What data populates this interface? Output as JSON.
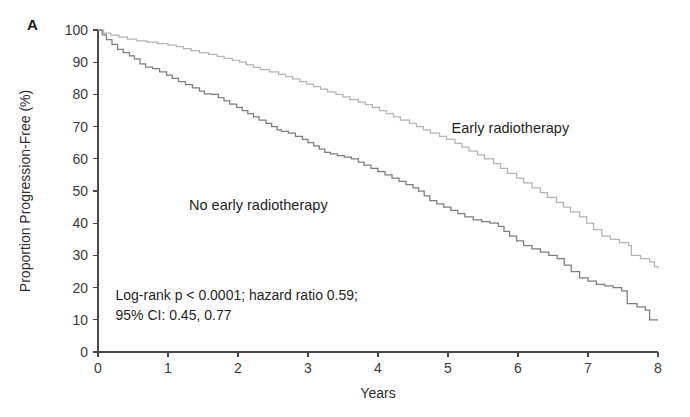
{
  "panel": {
    "label": "A"
  },
  "chart_data": {
    "type": "line",
    "subtype": "kaplan-meier-step",
    "title": "",
    "xlabel": "Years",
    "ylabel": "Proportion Progression-Free (%)",
    "xlim": [
      0,
      8
    ],
    "ylim": [
      0,
      100
    ],
    "xticks": [
      0,
      1,
      2,
      3,
      4,
      5,
      6,
      7,
      8
    ],
    "yticks": [
      0,
      10,
      20,
      30,
      40,
      50,
      60,
      70,
      80,
      90,
      100
    ],
    "grid": false,
    "legend_position": "inline-annotations",
    "annotations": [
      {
        "name": "early-radiotherapy-label",
        "text": "Early radiotherapy",
        "x": 5.05,
        "y": 68
      },
      {
        "name": "no-early-radiotherapy-label",
        "text": "No early radiotherapy",
        "x": 1.3,
        "y": 44
      },
      {
        "name": "stats-line-1",
        "text": "Log-rank p < 0.0001; hazard ratio 0.59;",
        "x": 0.25,
        "y": 16
      },
      {
        "name": "stats-line-2",
        "text": "95% CI: 0.45, 0.77",
        "x": 0.25,
        "y": 10
      }
    ],
    "series": [
      {
        "name": "Early radiotherapy",
        "color": "#b4b4b4",
        "points": [
          [
            0.0,
            100
          ],
          [
            0.08,
            99
          ],
          [
            0.18,
            98.4
          ],
          [
            0.3,
            97.8
          ],
          [
            0.42,
            97.2
          ],
          [
            0.55,
            96.6
          ],
          [
            0.7,
            96.2
          ],
          [
            0.85,
            95.8
          ],
          [
            1.0,
            95.3
          ],
          [
            1.12,
            94.8
          ],
          [
            1.22,
            94.2
          ],
          [
            1.33,
            93.6
          ],
          [
            1.45,
            93.0
          ],
          [
            1.58,
            92.4
          ],
          [
            1.7,
            91.8
          ],
          [
            1.8,
            91.2
          ],
          [
            1.92,
            90.6
          ],
          [
            2.02,
            90.0
          ],
          [
            2.12,
            89.2
          ],
          [
            2.22,
            88.4
          ],
          [
            2.32,
            87.7
          ],
          [
            2.45,
            87.0
          ],
          [
            2.58,
            86.2
          ],
          [
            2.68,
            85.5
          ],
          [
            2.78,
            84.8
          ],
          [
            2.88,
            84.0
          ],
          [
            2.98,
            83.2
          ],
          [
            3.08,
            82.4
          ],
          [
            3.18,
            81.6
          ],
          [
            3.28,
            80.8
          ],
          [
            3.4,
            80.0
          ],
          [
            3.5,
            79.2
          ],
          [
            3.6,
            78.4
          ],
          [
            3.72,
            77.6
          ],
          [
            3.82,
            76.8
          ],
          [
            3.92,
            76.0
          ],
          [
            4.02,
            75.0
          ],
          [
            4.12,
            74.0
          ],
          [
            4.22,
            73.0
          ],
          [
            4.32,
            72.0
          ],
          [
            4.45,
            71.0
          ],
          [
            4.55,
            70.0
          ],
          [
            4.65,
            69.0
          ],
          [
            4.75,
            68.0
          ],
          [
            4.88,
            67.0
          ],
          [
            4.98,
            66.0
          ],
          [
            5.1,
            64.8
          ],
          [
            5.2,
            63.6
          ],
          [
            5.3,
            62.4
          ],
          [
            5.42,
            61.2
          ],
          [
            5.52,
            60.0
          ],
          [
            5.65,
            58.5
          ],
          [
            5.75,
            57.0
          ],
          [
            5.85,
            55.5
          ],
          [
            5.98,
            54.0
          ],
          [
            6.08,
            52.5
          ],
          [
            6.2,
            51.0
          ],
          [
            6.32,
            49.5
          ],
          [
            6.42,
            48.0
          ],
          [
            6.55,
            46.5
          ],
          [
            6.65,
            45.0
          ],
          [
            6.75,
            43.5
          ],
          [
            6.88,
            42.0
          ],
          [
            6.98,
            40.0
          ],
          [
            7.08,
            38.0
          ],
          [
            7.2,
            36.0
          ],
          [
            7.32,
            35.0
          ],
          [
            7.45,
            34.0
          ],
          [
            7.58,
            33.0
          ],
          [
            7.62,
            30.0
          ],
          [
            7.75,
            29.0
          ],
          [
            7.88,
            28.0
          ],
          [
            7.95,
            26.5
          ],
          [
            8.0,
            26.0
          ]
        ]
      },
      {
        "name": "No early radiotherapy",
        "color": "#7d7d7d",
        "points": [
          [
            0.0,
            100
          ],
          [
            0.06,
            98.5
          ],
          [
            0.12,
            97.0
          ],
          [
            0.2,
            95.5
          ],
          [
            0.28,
            94.0
          ],
          [
            0.36,
            93.0
          ],
          [
            0.45,
            92.0
          ],
          [
            0.52,
            91.0
          ],
          [
            0.6,
            89.5
          ],
          [
            0.68,
            88.5
          ],
          [
            0.78,
            88.0
          ],
          [
            0.88,
            87.0
          ],
          [
            0.98,
            86.0
          ],
          [
            1.06,
            85.0
          ],
          [
            1.15,
            84.0
          ],
          [
            1.25,
            83.0
          ],
          [
            1.35,
            82.0
          ],
          [
            1.45,
            81.0
          ],
          [
            1.52,
            80.2
          ],
          [
            1.62,
            80.0
          ],
          [
            1.72,
            79.0
          ],
          [
            1.8,
            78.0
          ],
          [
            1.88,
            77.0
          ],
          [
            1.98,
            76.0
          ],
          [
            2.06,
            75.0
          ],
          [
            2.14,
            74.0
          ],
          [
            2.22,
            73.0
          ],
          [
            2.3,
            72.0
          ],
          [
            2.4,
            71.0
          ],
          [
            2.48,
            70.0
          ],
          [
            2.56,
            69.0
          ],
          [
            2.62,
            68.5
          ],
          [
            2.72,
            68.0
          ],
          [
            2.82,
            67.0
          ],
          [
            2.92,
            66.0
          ],
          [
            3.0,
            65.0
          ],
          [
            3.08,
            64.0
          ],
          [
            3.16,
            63.0
          ],
          [
            3.24,
            62.0
          ],
          [
            3.32,
            61.5
          ],
          [
            3.42,
            61.0
          ],
          [
            3.52,
            60.5
          ],
          [
            3.62,
            60.0
          ],
          [
            3.72,
            59.0
          ],
          [
            3.8,
            58.0
          ],
          [
            3.9,
            57.0
          ],
          [
            4.0,
            56.0
          ],
          [
            4.1,
            55.0
          ],
          [
            4.2,
            54.0
          ],
          [
            4.3,
            53.0
          ],
          [
            4.4,
            52.0
          ],
          [
            4.5,
            51.0
          ],
          [
            4.58,
            50.0
          ],
          [
            4.66,
            48.5
          ],
          [
            4.74,
            47.0
          ],
          [
            4.84,
            46.0
          ],
          [
            4.94,
            45.0
          ],
          [
            5.04,
            44.0
          ],
          [
            5.14,
            43.0
          ],
          [
            5.24,
            42.0
          ],
          [
            5.36,
            41.0
          ],
          [
            5.48,
            40.5
          ],
          [
            5.6,
            40.0
          ],
          [
            5.72,
            39.0
          ],
          [
            5.8,
            37.5
          ],
          [
            5.88,
            36.0
          ],
          [
            5.98,
            34.5
          ],
          [
            6.08,
            33.0
          ],
          [
            6.2,
            32.0
          ],
          [
            6.32,
            31.0
          ],
          [
            6.44,
            30.0
          ],
          [
            6.56,
            29.0
          ],
          [
            6.66,
            27.0
          ],
          [
            6.76,
            25.0
          ],
          [
            6.88,
            23.0
          ],
          [
            7.0,
            22.0
          ],
          [
            7.12,
            21.0
          ],
          [
            7.24,
            20.5
          ],
          [
            7.36,
            20.0
          ],
          [
            7.48,
            19.0
          ],
          [
            7.56,
            15.0
          ],
          [
            7.7,
            14.0
          ],
          [
            7.82,
            13.0
          ],
          [
            7.88,
            10.0
          ],
          [
            8.0,
            10.0
          ]
        ]
      }
    ]
  }
}
